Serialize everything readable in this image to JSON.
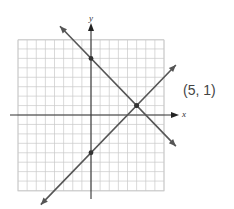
{
  "graph": {
    "x_axis_label": "x",
    "y_axis_label": "y",
    "grid_range": {
      "xmin": -8,
      "xmax": 8,
      "ymin": -8,
      "ymax": 8
    },
    "lines": [
      {
        "name": "decreasing-line",
        "equation": "y = -x + 6",
        "slope": -1,
        "intercept": 6,
        "marked_points": [
          [
            0,
            6
          ],
          [
            5,
            1
          ]
        ]
      },
      {
        "name": "increasing-line",
        "equation": "y = x - 4",
        "slope": 1,
        "intercept": -4,
        "marked_points": [
          [
            0,
            -4
          ],
          [
            5,
            1
          ]
        ]
      }
    ],
    "intersection": [
      5,
      1
    ],
    "colors": {
      "grid": "#c8c8c8",
      "axis": "#333333",
      "line": "#555555"
    }
  },
  "solution_label": "(5, 1)"
}
